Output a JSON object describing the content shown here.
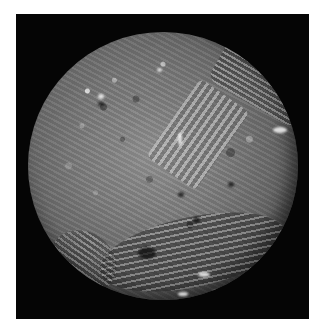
{
  "image": {
    "subject": "Cratered grey moon with grooved chevron and ovoid terrain on black background",
    "background_color": "#050505",
    "border_color": "#ffffff",
    "surface_tone": "#7a7a7a"
  }
}
